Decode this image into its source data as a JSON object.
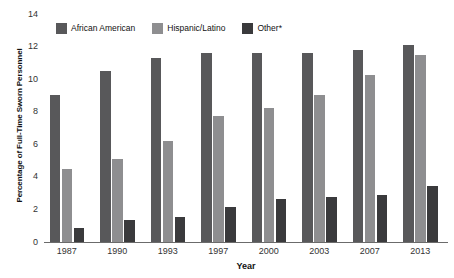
{
  "chart_data": {
    "type": "bar",
    "title": "",
    "xlabel": "Year",
    "ylabel": "Percentage of Full-Time Sworn Personnel",
    "categories": [
      "1987",
      "1990",
      "1993",
      "1997",
      "2000",
      "2003",
      "2007",
      "2013"
    ],
    "series": [
      {
        "name": "African American",
        "color": "#58585a",
        "values": [
          9.0,
          10.5,
          11.3,
          11.6,
          11.6,
          11.6,
          11.8,
          12.1
        ]
      },
      {
        "name": "Hispanic/Latino",
        "color": "#8e8e90",
        "values": [
          4.5,
          5.1,
          6.2,
          7.75,
          8.2,
          9.0,
          10.25,
          11.5
        ]
      },
      {
        "name": "Other*",
        "color": "#3a3a3c",
        "values": [
          0.85,
          1.35,
          1.55,
          2.15,
          2.65,
          2.75,
          2.9,
          3.45
        ]
      }
    ],
    "ylim": [
      0,
      14
    ],
    "yticks": [
      0,
      2,
      4,
      6,
      8,
      10,
      12,
      14
    ],
    "ytick_labels": [
      "0",
      "2",
      "4",
      "6",
      "8",
      "10",
      "12",
      "14"
    ],
    "grid": false,
    "legend_position": "top-left"
  },
  "colors": {
    "axis": "#6b6b6b",
    "text": "#111111",
    "background": "#ffffff"
  }
}
